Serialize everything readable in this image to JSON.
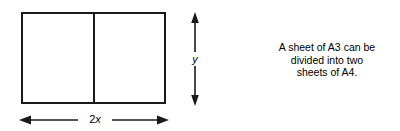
{
  "diagram": {
    "stroke_color": "#1a1a1a",
    "background_color": "#ffffff",
    "shape": {
      "name": "rectangle",
      "parts": 2,
      "divider": "vertical-center-line"
    },
    "dimensions": {
      "vertical": {
        "label": "y",
        "arrow": "double-headed",
        "orientation": "vertical"
      },
      "horizontal": {
        "label_prefix": "2",
        "label_variable": "x",
        "label_full": "2x",
        "arrow": "double-headed",
        "orientation": "horizontal"
      }
    }
  },
  "caption": {
    "line1": "A sheet of A3 can be",
    "line2": "divided into two",
    "line3": "sheets of A4."
  }
}
